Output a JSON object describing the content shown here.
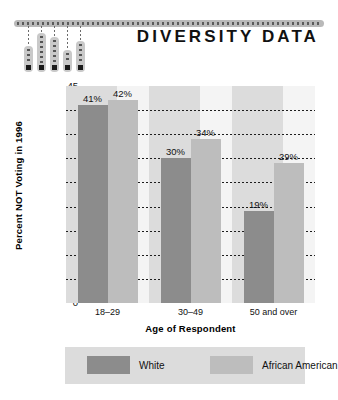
{
  "header": {
    "title": "DIVERSITY DATA",
    "decoration": {
      "name": "thermometer-bars-graphic",
      "rail_label": "dotted-rail",
      "bars": [
        {
          "height": 26,
          "left": 10
        },
        {
          "height": 39,
          "left": 23
        },
        {
          "height": 35,
          "left": 36
        },
        {
          "height": 22,
          "left": 49
        },
        {
          "height": 31,
          "left": 62
        }
      ]
    }
  },
  "chart_data": {
    "type": "bar",
    "title": "DIVERSITY DATA",
    "xlabel": "Age of Respondent",
    "ylabel": "Percent NOT Voting in 1996",
    "categories": [
      "18–29",
      "30–49",
      "50 and over"
    ],
    "series": [
      {
        "name": "White",
        "color": "#8c8c8c",
        "values": [
          41,
          30,
          19
        ],
        "labels": [
          "41%",
          "30%",
          "19%"
        ]
      },
      {
        "name": "African American",
        "color": "#bdbdbd",
        "values": [
          42,
          34,
          29
        ],
        "labels": [
          "42%",
          "34%",
          "29%"
        ]
      }
    ],
    "ylim": [
      0,
      45
    ],
    "ytick_step": 5,
    "yticks": [
      "45",
      "40",
      "35",
      "30",
      "25",
      "20",
      "15",
      "10",
      "5",
      "0"
    ],
    "ytick_values": [
      45,
      40,
      35,
      30,
      25,
      20,
      15,
      10,
      5,
      0
    ],
    "grid": true,
    "grid_style": "dotted",
    "legend_position": "bottom"
  },
  "legend": {
    "items": [
      {
        "label": "White",
        "color": "#8c8c8c"
      },
      {
        "label": "African American",
        "color": "#bdbdbd"
      }
    ]
  }
}
